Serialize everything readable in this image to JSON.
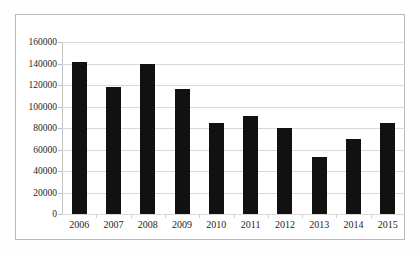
{
  "chart_data": {
    "type": "bar",
    "title": "",
    "subtitle": "",
    "xlabel": "",
    "ylabel": "",
    "categories": [
      "2006",
      "2007",
      "2008",
      "2009",
      "2010",
      "2011",
      "2012",
      "2013",
      "2014",
      "2015"
    ],
    "values": [
      141500,
      118000,
      140000,
      116500,
      85000,
      91000,
      80000,
      53000,
      70000,
      85000
    ],
    "ylim": [
      0,
      160000
    ],
    "ytick_values": [
      0,
      20000,
      40000,
      60000,
      80000,
      100000,
      120000,
      140000,
      160000
    ],
    "ytick_labels": [
      "0",
      "20000",
      "40000",
      "60000",
      "80000",
      "100000",
      "120000",
      "140000",
      "160000"
    ],
    "grid": true,
    "grid_axis": "y",
    "legend": false,
    "legend_position": "none",
    "series": [
      {
        "name": "",
        "color": "#111111",
        "values": [
          141500,
          118000,
          140000,
          116500,
          85000,
          91000,
          80000,
          53000,
          70000,
          85000
        ]
      }
    ]
  },
  "style": {
    "bar_color": "#111111",
    "grid_color": "#d8d8d8",
    "axis_color": "#c3c3c3",
    "frame_color": "#b9b9b9",
    "background": "#ffffff",
    "text_color": "#252525"
  }
}
